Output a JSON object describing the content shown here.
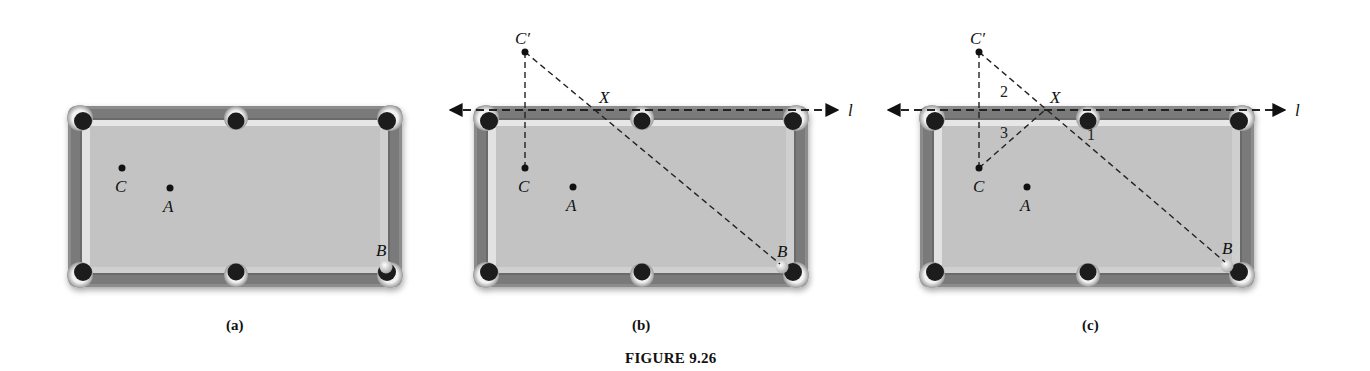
{
  "figure": {
    "caption": "FIGURE 9.26",
    "panels": [
      {
        "id": "a",
        "caption": "(a)",
        "table": {
          "x": 68,
          "y": 106,
          "w": 334,
          "h": 181
        },
        "points": {
          "C": {
            "label": "C",
            "x": 122,
            "y": 168
          },
          "A": {
            "label": "A",
            "x": 170,
            "y": 188
          },
          "B": {
            "label": "B",
            "x": 386,
            "y": 262
          }
        }
      },
      {
        "id": "b",
        "caption": "(b)",
        "table": {
          "x": 474,
          "y": 106,
          "w": 334,
          "h": 181
        },
        "line_label": "l",
        "points": {
          "C_prime": {
            "label": "C′",
            "x": 525,
            "y": 52
          },
          "C": {
            "label": "C",
            "x": 525,
            "y": 168
          },
          "A": {
            "label": "A",
            "x": 573,
            "y": 187
          },
          "B": {
            "label": "B",
            "x": 782,
            "y": 264
          },
          "X": {
            "label": "X",
            "x": 592,
            "y": 110
          }
        }
      },
      {
        "id": "c",
        "caption": "(c)",
        "table": {
          "x": 920,
          "y": 106,
          "w": 335,
          "h": 181
        },
        "line_label": "l",
        "points": {
          "C_prime": {
            "label": "C′",
            "x": 979,
            "y": 52
          },
          "C": {
            "label": "C",
            "x": 979,
            "y": 168
          },
          "A": {
            "label": "A",
            "x": 1027,
            "y": 187
          },
          "B": {
            "label": "B",
            "x": 1227,
            "y": 262
          },
          "X": {
            "label": "X",
            "x": 1045,
            "y": 110
          }
        },
        "angle_labels": [
          "1",
          "2",
          "3"
        ]
      }
    ]
  },
  "colors": {
    "rail_outer": "#8a8a8a",
    "rail_dark": "#6e6e6e",
    "cushion": "#dedede",
    "felt": "#c2c2c2",
    "pocket": "#1e1e1e",
    "pocket_rim": "#b0b0b0",
    "ball": "#e8e8e8",
    "ink": "#111111"
  }
}
